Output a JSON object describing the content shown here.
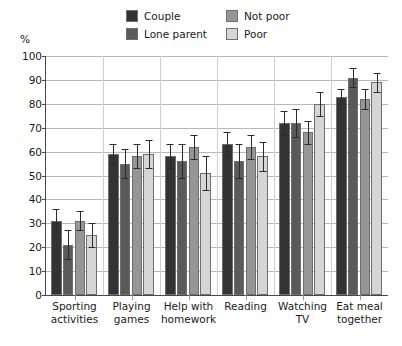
{
  "unit_label": "%",
  "legend": {
    "items": [
      {
        "label": "Couple",
        "color": "#333333",
        "col": 0,
        "row": 0
      },
      {
        "label": "Lone parent",
        "color": "#5a5a5a",
        "col": 0,
        "row": 1
      },
      {
        "label": "Not poor",
        "color": "#969696",
        "col": 1,
        "row": 0
      },
      {
        "label": "Poor",
        "color": "#d6d6d6",
        "col": 1,
        "row": 1
      }
    ]
  },
  "chart_data": {
    "type": "bar",
    "title": "",
    "subtitle": "",
    "xlabel": "",
    "ylabel": "%",
    "ylim": [
      0,
      100
    ],
    "ytick_step": 10,
    "yticks": [
      0,
      10,
      20,
      30,
      40,
      50,
      60,
      70,
      80,
      90,
      100
    ],
    "ytick_labels": [
      "0",
      "10",
      "20",
      "30",
      "40",
      "50",
      "60",
      "70",
      "80",
      "90",
      "100"
    ],
    "grid": "horizontal",
    "legend_position": "top",
    "error_bars": true,
    "categories": [
      "Sporting activities",
      "Playing games",
      "Help with homework",
      "Reading",
      "Watching TV",
      "Eat meal together"
    ],
    "category_lines": [
      [
        "Sporting",
        "activities"
      ],
      [
        "Playing",
        "games"
      ],
      [
        "Help with",
        "homework"
      ],
      [
        "Reading",
        ""
      ],
      [
        "Watching",
        "TV"
      ],
      [
        "Eat meal",
        "together"
      ]
    ],
    "series": [
      {
        "name": "Couple",
        "color": "#333333",
        "values": [
          31,
          59,
          58,
          63,
          72,
          83
        ],
        "err_low": [
          5,
          4,
          5,
          5,
          5,
          3
        ],
        "err_high": [
          5,
          4,
          5,
          5,
          5,
          3
        ]
      },
      {
        "name": "Lone parent",
        "color": "#5a5a5a",
        "values": [
          21,
          55,
          56,
          56,
          72,
          91
        ],
        "err_low": [
          6,
          6,
          7,
          7,
          6,
          4
        ],
        "err_high": [
          6,
          6,
          7,
          7,
          6,
          4
        ]
      },
      {
        "name": "Not poor",
        "color": "#969696",
        "values": [
          31,
          58,
          62,
          62,
          68,
          82
        ],
        "err_low": [
          4,
          5,
          5,
          5,
          5,
          4
        ],
        "err_high": [
          4,
          5,
          5,
          5,
          5,
          4
        ]
      },
      {
        "name": "Poor",
        "color": "#d6d6d6",
        "values": [
          25,
          59,
          51,
          58,
          80,
          89
        ],
        "err_low": [
          5,
          6,
          7,
          6,
          5,
          4
        ],
        "err_high": [
          5,
          6,
          7,
          6,
          5,
          4
        ]
      }
    ]
  }
}
